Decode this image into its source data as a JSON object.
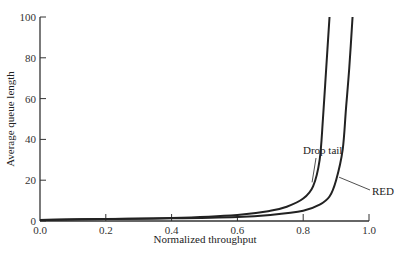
{
  "chart_data": {
    "type": "line",
    "title": "",
    "xlabel": "Normalized throughput",
    "ylabel": "Average queue length",
    "xlim": [
      0.0,
      1.0
    ],
    "ylim": [
      0,
      100
    ],
    "xticks": [
      "0.0",
      "0.2",
      "0.4",
      "0.6",
      "0.8",
      "1.0"
    ],
    "yticks": [
      "0",
      "20",
      "40",
      "60",
      "80",
      "100"
    ],
    "grid": false,
    "legend": "none (inline annotations)",
    "series": [
      {
        "name": "Drop tail",
        "x": [
          0.0,
          0.2,
          0.4,
          0.6,
          0.7,
          0.75,
          0.8,
          0.83,
          0.85,
          0.86,
          0.87,
          0.88
        ],
        "y": [
          0.5,
          1,
          1.5,
          3,
          5,
          7,
          11,
          17,
          30,
          50,
          75,
          100
        ]
      },
      {
        "name": "RED",
        "x": [
          0.0,
          0.2,
          0.4,
          0.6,
          0.7,
          0.8,
          0.85,
          0.88,
          0.9,
          0.92,
          0.93,
          0.94,
          0.95
        ],
        "y": [
          0.5,
          1,
          1.3,
          2,
          3,
          5,
          8,
          12,
          20,
          35,
          55,
          75,
          100
        ]
      }
    ],
    "annotations": [
      {
        "text": "Drop tail",
        "target_x": 0.83,
        "target_y": 17
      },
      {
        "text": "RED",
        "target_x": 0.9,
        "target_y": 20
      }
    ]
  }
}
